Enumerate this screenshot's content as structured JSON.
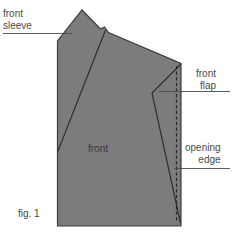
{
  "figure": {
    "caption": "fig. 1",
    "background_color": "#ffffff",
    "piece_fill_color": "#7c7c7c",
    "outline_color": "#3c3c3c",
    "leader_line_color": "#4a4a4a",
    "label_text_color": "#4a4a4a"
  },
  "labels": {
    "front_sleeve": "front\nsleeve",
    "front_flap": "front\nflap",
    "opening_edge": "opening\nedge",
    "front_piece": "front"
  },
  "annotations": [
    {
      "name": "front-sleeve",
      "text": "front\nsleeve",
      "leader_from": [
        3,
        33
      ],
      "leader_to": [
        72,
        33
      ]
    },
    {
      "name": "front-flap",
      "text": "front\nflap",
      "leader_from": [
        229,
        91
      ],
      "leader_to": [
        160,
        91
      ]
    },
    {
      "name": "opening-edge",
      "text": "opening\nedge",
      "leader_from": [
        229,
        168
      ],
      "leader_to": [
        174,
        168
      ]
    }
  ],
  "geometry": {
    "piece_outline": "M 57.5 226 L 57.5 40 L 82 10 L 100 29 L 104 27.5 L 108 32.5 L 181 63.5 L 181 226 Z",
    "sleeve_seam": "M 58 151 L 105 30",
    "flap_seam": "M 181 63.5 L 152 93 L 180.5 223",
    "opening_edge_dashed": "M 176.5 66 L 176.5 222",
    "bottom_edge_y": 226,
    "right_edge_x": 181,
    "left_edge_x": 57.5
  }
}
